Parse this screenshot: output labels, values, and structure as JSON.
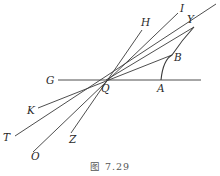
{
  "figure": {
    "caption": "图 7.29",
    "center_point": "Q",
    "points": {
      "G": "G",
      "Q": "Q",
      "A": "A",
      "B": "B",
      "Y": "Y",
      "H": "H",
      "I": "I",
      "K": "K",
      "T": "T",
      "O": "O",
      "Z": "Z"
    },
    "lines": [
      {
        "name": "GA",
        "from": "G",
        "to": "A",
        "description": "horizontal line through Q"
      },
      {
        "name": "HZ",
        "from": "H",
        "to": "Z",
        "description": "line through Q"
      },
      {
        "name": "IO",
        "from": "I",
        "to": "O",
        "description": "line through Q"
      },
      {
        "name": "YT",
        "from": "Y",
        "to": "T",
        "description": "line through Q extending past Y"
      },
      {
        "name": "BK",
        "from": "B",
        "to": "K",
        "description": "line through Q"
      }
    ],
    "curves": [
      {
        "name": "AY",
        "from": "A",
        "to": "Y",
        "through": "B",
        "description": "arc from A up through B to Y"
      }
    ],
    "stroke_color": "#3a3a3a"
  }
}
